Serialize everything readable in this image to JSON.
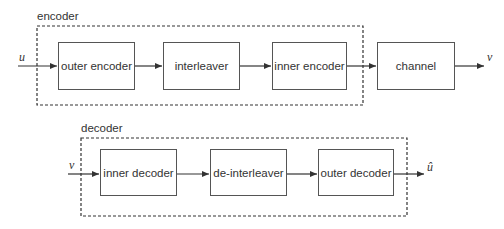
{
  "encoder": {
    "group_label": "encoder",
    "input": "u",
    "blocks": [
      "outer encoder",
      "interleaver",
      "inner encoder"
    ],
    "channel": "channel",
    "output": "v"
  },
  "decoder": {
    "group_label": "decoder",
    "input": "v",
    "blocks": [
      "inner decoder",
      "de-interleaver",
      "outer decoder"
    ],
    "output": "û"
  }
}
